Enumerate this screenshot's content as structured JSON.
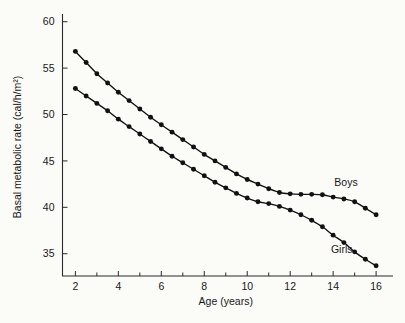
{
  "chart_data": {
    "type": "line",
    "title": "",
    "xlabel": "Age  (years)",
    "ylabel": "Basal metabolic rate  (cal/h/m²)",
    "xlim": [
      1.4,
      16.6
    ],
    "ylim": [
      32.6,
      60.4
    ],
    "grid": false,
    "legend_position": "inline-at-line-end",
    "x_major_ticks": [
      2,
      4,
      6,
      8,
      10,
      12,
      14,
      16
    ],
    "x_major_tick_labels": [
      "2",
      "4",
      "6",
      "8",
      "10",
      "12",
      "14",
      "16"
    ],
    "x_minor_ticks": [
      3,
      5,
      7,
      9,
      11,
      13,
      15
    ],
    "y_major_ticks": [
      35,
      40,
      45,
      50,
      55,
      60
    ],
    "y_major_tick_labels": [
      "35",
      "40",
      "45",
      "50",
      "55",
      "60"
    ],
    "x": [
      2,
      2.5,
      3,
      3.5,
      4,
      4.5,
      5,
      5.5,
      6,
      6.5,
      7,
      7.5,
      8,
      8.5,
      9,
      9.5,
      10,
      10.5,
      11,
      11.5,
      12,
      12.5,
      13,
      13.5,
      14,
      14.5,
      15,
      15.5,
      16
    ],
    "series": [
      {
        "name": "Boys",
        "color": "#111113",
        "marker": "filled-circle",
        "label_x": 14.6,
        "label_y": 42.3,
        "values": [
          56.8,
          55.6,
          54.4,
          53.4,
          52.4,
          51.5,
          50.6,
          49.7,
          48.9,
          48.1,
          47.3,
          46.5,
          45.7,
          45.0,
          44.3,
          43.6,
          43.0,
          42.5,
          42.0,
          41.6,
          41.45,
          41.4,
          41.4,
          41.35,
          41.1,
          40.9,
          40.6,
          39.9,
          39.2
        ]
      },
      {
        "name": "Girls",
        "color": "#111113",
        "marker": "filled-circle",
        "label_x": 14.4,
        "label_y": 35.1,
        "values": [
          52.8,
          52.0,
          51.2,
          50.4,
          49.5,
          48.7,
          47.9,
          47.1,
          46.3,
          45.5,
          44.8,
          44.1,
          43.4,
          42.7,
          42.1,
          41.5,
          41.0,
          40.6,
          40.4,
          40.1,
          39.7,
          39.2,
          38.6,
          37.9,
          37.0,
          36.2,
          35.2,
          34.4,
          33.7
        ]
      }
    ]
  }
}
